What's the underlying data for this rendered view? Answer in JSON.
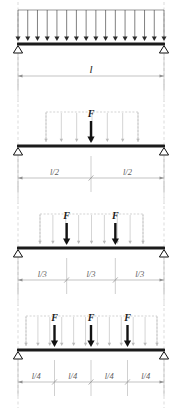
{
  "figure": {
    "background": "#ffffff",
    "beam_color": "#1b1b1b",
    "load_color": "#121212",
    "dim_color": "#9a9a9a",
    "ghost_color": "#b9b9b9",
    "width": 182,
    "height": 413,
    "span_left": 18,
    "span_right": 164
  },
  "labels": {
    "force": "F",
    "length": "l",
    "half": "l/2",
    "third": "l/3",
    "quarter": "l/4"
  },
  "cases": [
    {
      "id": "case-1",
      "name": "uniformly-distributed-load",
      "beam_y": 44,
      "load_type": "udl",
      "udl_arrow_count": 16,
      "udl_top_y": 10,
      "point_loads": [],
      "ghost_udl": false,
      "dimension": {
        "y": 76,
        "segments": [
          {
            "label": "l",
            "fraction": 1
          }
        ]
      }
    },
    {
      "id": "case-2",
      "name": "single-point-load-midspan",
      "beam_y": 146,
      "load_type": "point",
      "udl_arrow_count": 0,
      "ghost_udl": true,
      "ghost_left": 46,
      "ghost_right": 138,
      "ghost_top_y": 112,
      "ghost_arrow_count": 7,
      "point_loads": [
        {
          "label": "F",
          "position": 0.5,
          "top_y": 110
        }
      ],
      "dimension": {
        "y": 178,
        "segments": [
          {
            "label": "l/2",
            "fraction": 0.5
          },
          {
            "label": "l/2",
            "fraction": 0.5
          }
        ]
      }
    },
    {
      "id": "case-3",
      "name": "two-point-loads-thirds",
      "beam_y": 248,
      "load_type": "point",
      "udl_arrow_count": 0,
      "ghost_udl": true,
      "ghost_left": 40,
      "ghost_right": 143,
      "ghost_top_y": 214,
      "ghost_arrow_count": 9,
      "point_loads": [
        {
          "label": "F",
          "position": 0.3333,
          "top_y": 212
        },
        {
          "label": "F",
          "position": 0.6667,
          "top_y": 212
        }
      ],
      "dimension": {
        "y": 280,
        "segments": [
          {
            "label": "l/3",
            "fraction": 0.3333
          },
          {
            "label": "l/3",
            "fraction": 0.3333
          },
          {
            "label": "l/3",
            "fraction": 0.3333
          }
        ]
      }
    },
    {
      "id": "case-4",
      "name": "three-point-loads-quarters",
      "beam_y": 350,
      "load_type": "point",
      "udl_arrow_count": 0,
      "ghost_udl": true,
      "ghost_left": 26,
      "ghost_right": 157,
      "ghost_top_y": 316,
      "ghost_arrow_count": 12,
      "point_loads": [
        {
          "label": "F",
          "position": 0.25,
          "top_y": 314
        },
        {
          "label": "F",
          "position": 0.5,
          "top_y": 314
        },
        {
          "label": "F",
          "position": 0.75,
          "top_y": 314
        }
      ],
      "dimension": {
        "y": 382,
        "segments": [
          {
            "label": "l/4",
            "fraction": 0.25
          },
          {
            "label": "l/4",
            "fraction": 0.25
          },
          {
            "label": "l/4",
            "fraction": 0.25
          },
          {
            "label": "l/4",
            "fraction": 0.25
          }
        ]
      }
    }
  ]
}
